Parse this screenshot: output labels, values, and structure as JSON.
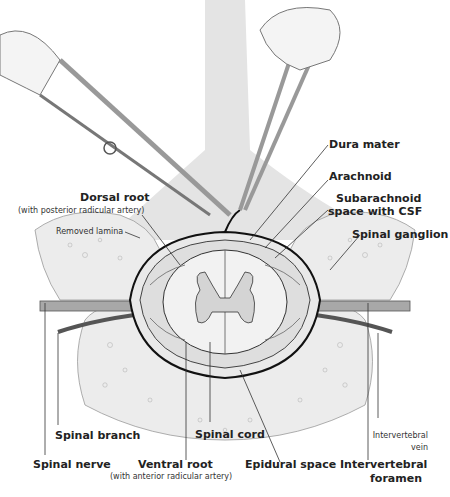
{
  "figure": {
    "type": "anatomical-illustration"
  },
  "labels": {
    "dura_mater": "Dura mater",
    "arachnoid": "Arachnoid",
    "subarachnoid_1": "Subarachnoid",
    "subarachnoid_2": "space with CSF",
    "dorsal_root": "Dorsal root",
    "dorsal_root_sub": "(with posterior radicular artery)",
    "removed_lamina": "Removed lamina",
    "spinal_ganglion": "Spinal ganglion",
    "spinal_branch": "Spinal branch",
    "spinal_cord": "Spinal cord",
    "intervertebral_vein_1": "Intervertebral",
    "intervertebral_vein_2": "vein",
    "spinal_nerve": "Spinal nerve",
    "ventral_root": "Ventral root",
    "ventral_root_sub": "(with anterior radicular artery)",
    "epidural_space": "Epidural space",
    "intervertebral_foramen_1": "Intervertebral",
    "intervertebral_foramen_2": "foramen"
  },
  "colors": {
    "bone": "#e6e6e6",
    "shade": "#d9d9d9",
    "line": "#222222",
    "nerve": "#8a8a8a",
    "vessel": "#555555"
  }
}
